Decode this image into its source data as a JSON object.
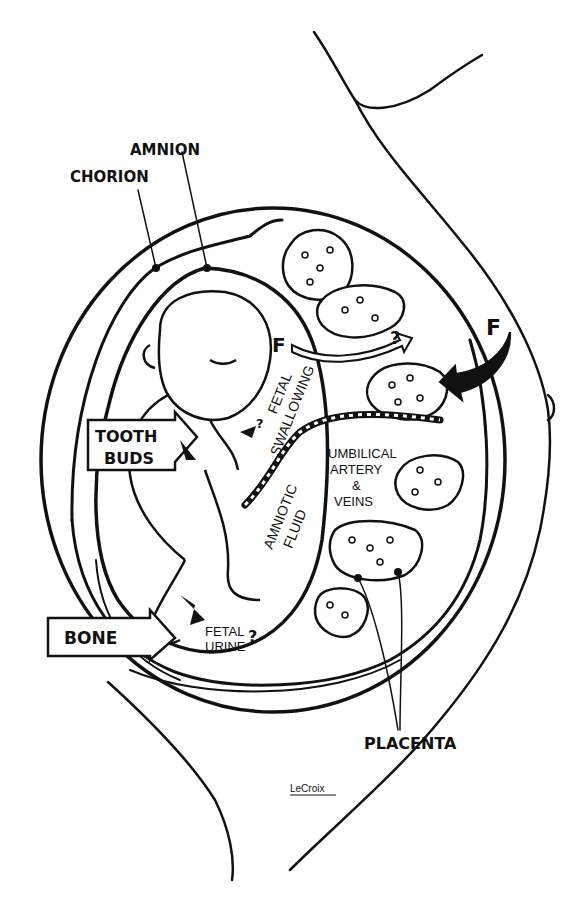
{
  "figure": {
    "ink_color": "#111111",
    "paper_color": "#ffffff"
  },
  "labels": {
    "amnion": "AMNION",
    "chorion": "CHORION",
    "tooth_buds_line1": "TOOTH",
    "tooth_buds_line2": "BUDS",
    "bone": "BONE",
    "placenta": "PLACENTA",
    "fetal_swallowing_line1": "FETAL",
    "fetal_swallowing_line2": "SWALLOWING",
    "amniotic_fluid_line1": "AMNIOTIC",
    "amniotic_fluid_line2": "FLUID",
    "umbilical_line1": "UMBILICAL",
    "umbilical_line2": "ARTERY",
    "umbilical_line3": "&",
    "umbilical_line4": "VEINS",
    "fetal_urine_line1": "FETAL",
    "fetal_urine_line2": "URINE",
    "question_mark": "?",
    "fluoride_left": "F",
    "fluoride_right": "F",
    "signature": "LeCroix"
  }
}
